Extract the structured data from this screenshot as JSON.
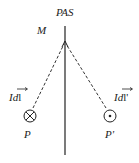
{
  "diagram": {
    "axis_label": "PAS",
    "point_on_axis_label": "M",
    "left_element": {
      "label": "Idl",
      "vector_symbol": "Idl→",
      "point_label": "P",
      "icon": "into-page-icon"
    },
    "right_element": {
      "label": "Idl'",
      "vector_symbol": "Idl'→",
      "point_label": "P'",
      "icon": "out-of-page-icon"
    },
    "colors": {
      "line": "#222222",
      "background": "#ffffff"
    }
  }
}
